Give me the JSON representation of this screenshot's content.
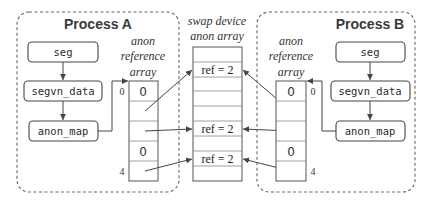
{
  "process_a": {
    "title": "Process A",
    "boxes": [
      "seg",
      "segvn_data",
      "anon_map"
    ],
    "array_label": [
      "anon",
      "reference",
      "array"
    ],
    "cells": [
      "0",
      "",
      "",
      "0",
      ""
    ],
    "index_first": "0",
    "index_last": "4"
  },
  "swap": {
    "label": [
      "swap device",
      "anon array"
    ],
    "cells": [
      "",
      "ref = 2",
      "",
      "",
      "",
      "ref = 2",
      "",
      "ref = 2",
      ""
    ]
  },
  "process_b": {
    "title": "Process B",
    "boxes": [
      "seg",
      "segvn_data",
      "anon_map"
    ],
    "array_label": [
      "anon",
      "reference",
      "array"
    ],
    "cells": [
      "0",
      "",
      "",
      "0",
      ""
    ],
    "index_first": "0",
    "index_last": "4"
  }
}
